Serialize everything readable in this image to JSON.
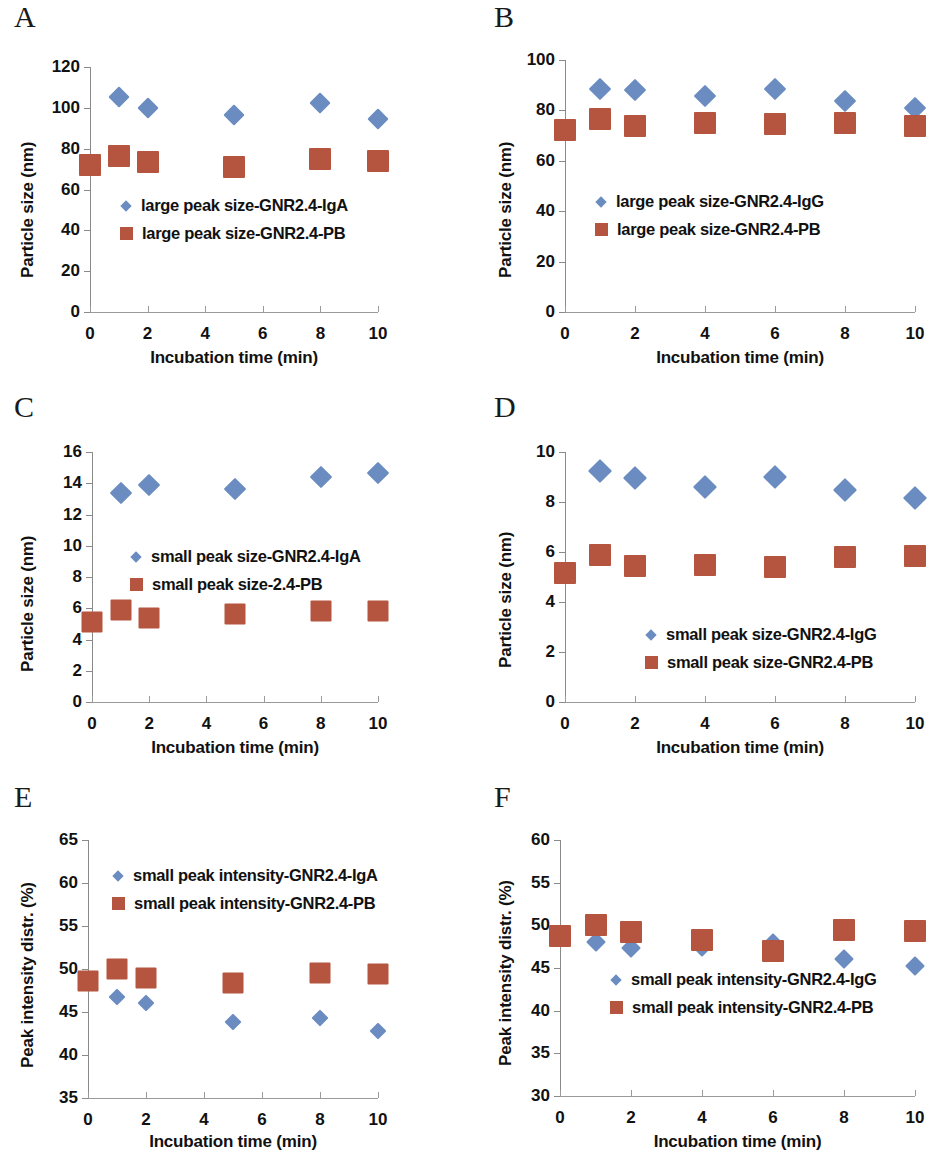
{
  "figure": {
    "panel_letters": [
      "A",
      "B",
      "C",
      "D",
      "E",
      "F"
    ],
    "colors": {
      "series_blue": "#6a8cc0",
      "series_red": "#b6553f",
      "axis": "#8a8a8a",
      "text": "#111111"
    }
  },
  "chart_data": [
    {
      "panel": "A",
      "type": "scatter",
      "title": "",
      "xlabel": "Incubation time (min)",
      "ylabel": "Particle size (nm)",
      "xlim": [
        0,
        10
      ],
      "ylim": [
        0,
        120
      ],
      "xticks": [
        "0",
        "2",
        "4",
        "6",
        "8",
        "10"
      ],
      "yticks": [
        "0",
        "20",
        "40",
        "60",
        "80",
        "100",
        "120"
      ],
      "grid": false,
      "legend_position": "center-left",
      "x": [
        0,
        1,
        2,
        5,
        8,
        10
      ],
      "series": [
        {
          "name": "large peak size-GNR2.4-IgA",
          "marker": "diamond",
          "color": "#6a8cc0",
          "values": [
            null,
            105.2,
            99.8,
            96.5,
            102.4,
            94.7
          ]
        },
        {
          "name": "large peak size-GNR2.4-PB",
          "marker": "square",
          "color": "#b6553f",
          "values": [
            72.0,
            76.2,
            73.6,
            71.0,
            74.8,
            73.8
          ]
        }
      ]
    },
    {
      "panel": "B",
      "type": "scatter",
      "title": "",
      "xlabel": "Incubation time (min)",
      "ylabel": "Particle size (nm)",
      "xlim": [
        0,
        10
      ],
      "ylim": [
        0,
        100
      ],
      "xticks": [
        "0",
        "2",
        "4",
        "6",
        "8",
        "10"
      ],
      "yticks": [
        "0",
        "20",
        "40",
        "60",
        "80",
        "100"
      ],
      "grid": false,
      "legend_position": "center-left",
      "x": [
        0,
        1,
        2,
        4,
        6,
        8,
        10
      ],
      "series": [
        {
          "name": "large peak size-GNR2.4-IgG",
          "marker": "diamond",
          "color": "#6a8cc0",
          "values": [
            null,
            88.3,
            88.0,
            85.9,
            88.4,
            83.8,
            80.9
          ]
        },
        {
          "name": "large peak size-GNR2.4-PB",
          "marker": "square",
          "color": "#b6553f",
          "values": [
            72.4,
            76.4,
            73.9,
            75.0,
            74.8,
            75.0,
            73.7
          ]
        }
      ]
    },
    {
      "panel": "C",
      "type": "scatter",
      "title": "",
      "xlabel": "Incubation time (min)",
      "ylabel": "Particle size (nm)",
      "xlim": [
        0,
        10
      ],
      "ylim": [
        0,
        16
      ],
      "xticks": [
        "0",
        "2",
        "4",
        "6",
        "8",
        "10"
      ],
      "yticks": [
        "0",
        "2",
        "4",
        "6",
        "8",
        "10",
        "12",
        "14",
        "16"
      ],
      "grid": false,
      "legend_position": "center-left",
      "x": [
        0,
        1,
        2,
        5,
        8,
        10
      ],
      "series": [
        {
          "name": "small peak size-GNR2.4-IgA",
          "marker": "diamond",
          "color": "#6a8cc0",
          "values": [
            null,
            13.4,
            13.9,
            13.65,
            14.4,
            14.65
          ]
        },
        {
          "name": "small peak size-2.4-PB",
          "marker": "square",
          "color": "#b6553f",
          "values": [
            5.1,
            5.9,
            5.35,
            5.65,
            5.8,
            5.8
          ]
        }
      ]
    },
    {
      "panel": "D",
      "type": "scatter",
      "title": "",
      "xlabel": "Incubation time (min)",
      "ylabel": "Particle size (nm)",
      "xlim": [
        0,
        10
      ],
      "ylim": [
        0,
        10
      ],
      "xticks": [
        "0",
        "2",
        "4",
        "6",
        "8",
        "10"
      ],
      "yticks": [
        "0",
        "2",
        "4",
        "6",
        "8",
        "10"
      ],
      "grid": false,
      "legend_position": "center",
      "x": [
        0,
        1,
        2,
        4,
        6,
        8,
        10
      ],
      "series": [
        {
          "name": "small peak size-GNR2.4-IgG",
          "marker": "diamond",
          "color": "#6a8cc0",
          "values": [
            null,
            9.25,
            8.95,
            8.6,
            9.0,
            8.5,
            8.15
          ]
        },
        {
          "name": "small peak size-GNR2.4-PB",
          "marker": "square",
          "color": "#b6553f",
          "values": [
            5.15,
            5.9,
            5.45,
            5.5,
            5.4,
            5.8,
            5.85
          ]
        }
      ]
    },
    {
      "panel": "E",
      "type": "scatter",
      "title": "",
      "xlabel": "Incubation time (min)",
      "ylabel": "Peak intensity distr. (%)",
      "xlim": [
        0,
        10
      ],
      "ylim": [
        35,
        65
      ],
      "xticks": [
        "0",
        "2",
        "4",
        "6",
        "8",
        "10"
      ],
      "yticks": [
        "35",
        "40",
        "45",
        "50",
        "55",
        "60",
        "65"
      ],
      "grid": false,
      "legend_position": "upper-left",
      "x": [
        0,
        1,
        2,
        5,
        8,
        10
      ],
      "series": [
        {
          "name": "small peak intensity-GNR2.4-IgA",
          "marker": "diamond",
          "color": "#6a8cc0",
          "values": [
            null,
            46.8,
            46.1,
            43.8,
            44.3,
            42.8
          ]
        },
        {
          "name": "small peak intensity-GNR2.4-PB",
          "marker": "square",
          "color": "#b6553f",
          "values": [
            48.6,
            50.0,
            49.0,
            48.4,
            49.5,
            49.4
          ]
        }
      ]
    },
    {
      "panel": "F",
      "type": "scatter",
      "title": "",
      "xlabel": "Incubation time (min)",
      "ylabel": "Peak intensity distr. (%)",
      "xlim": [
        0,
        10
      ],
      "ylim": [
        30,
        60
      ],
      "xticks": [
        "0",
        "2",
        "4",
        "6",
        "8",
        "10"
      ],
      "yticks": [
        "30",
        "35",
        "40",
        "45",
        "50",
        "55",
        "60"
      ],
      "grid": false,
      "legend_position": "center-left",
      "x": [
        0,
        1,
        2,
        4,
        6,
        8,
        10
      ],
      "series": [
        {
          "name": "small peak intensity-GNR2.4-IgG",
          "marker": "diamond",
          "color": "#6a8cc0",
          "values": [
            null,
            48.0,
            47.3,
            47.5,
            47.9,
            46.1,
            45.2
          ]
        },
        {
          "name": "small peak intensity-GNR2.4-PB",
          "marker": "square",
          "color": "#b6553f",
          "values": [
            48.7,
            50.0,
            49.2,
            48.3,
            47.0,
            49.4,
            49.3
          ]
        }
      ]
    }
  ]
}
